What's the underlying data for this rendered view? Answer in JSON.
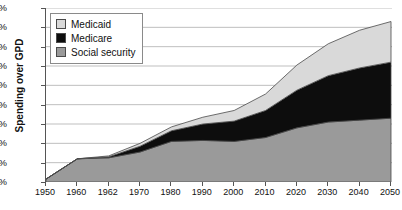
{
  "chart_data": {
    "type": "area",
    "stacked": true,
    "title": "",
    "xlabel": "",
    "ylabel": "Spending over GPD",
    "ylim": [
      0,
      18
    ],
    "ytick_values": [
      0,
      2,
      4,
      6,
      8,
      10,
      12,
      14,
      16,
      18
    ],
    "ytick_labels": [
      "0%",
      "2%",
      "4%",
      "6%",
      "8%",
      "10%",
      "12%",
      "14%",
      "16%",
      "18%"
    ],
    "categories": [
      "1950",
      "1960",
      "1962",
      "1970",
      "1980",
      "1990",
      "2000",
      "2010",
      "2020",
      "2030",
      "2040",
      "2050"
    ],
    "grid": "horizontal",
    "legend_position": "top-left",
    "series": [
      {
        "name": "Social security",
        "color": "#9a9a9a",
        "values": [
          0.3,
          2.4,
          2.5,
          3.1,
          4.2,
          4.3,
          4.2,
          4.6,
          5.6,
          6.2,
          6.4,
          6.6
        ]
      },
      {
        "name": "Medicare",
        "color": "#0d0d0d",
        "values": [
          0.0,
          0.0,
          0.1,
          0.6,
          1.1,
          1.7,
          2.1,
          2.8,
          3.9,
          4.8,
          5.4,
          5.8
        ]
      },
      {
        "name": "Medicaid",
        "color": "#d9d9d9",
        "values": [
          0.0,
          0.0,
          0.1,
          0.3,
          0.4,
          0.7,
          1.1,
          1.7,
          2.6,
          3.3,
          3.9,
          4.2
        ]
      }
    ]
  },
  "legend": {
    "items": [
      {
        "label": "Medicaid",
        "color": "#d9d9d9"
      },
      {
        "label": "Medicare",
        "color": "#0d0d0d"
      },
      {
        "label": "Social security",
        "color": "#9a9a9a"
      }
    ]
  },
  "axes": {
    "y_title": "Spending over GPD"
  }
}
